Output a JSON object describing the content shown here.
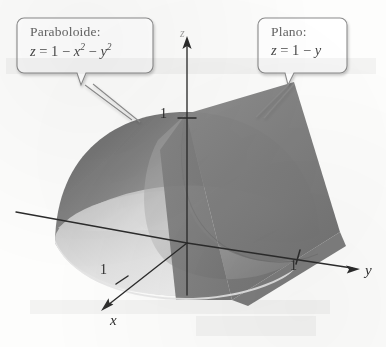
{
  "figure": {
    "kind": "3d-solid-diagram",
    "background_color": "#fdfdfc"
  },
  "callouts": [
    {
      "id": "paraboloid",
      "title": "Paraboloide:",
      "equation_plain": "z = 1 - x2 - y2",
      "lhs": "z",
      "eq": "=",
      "term1": "1",
      "minus1": "−",
      "term2_base": "x",
      "term2_exp": "2",
      "minus2": "−",
      "term3_base": "y",
      "term3_exp": "2"
    },
    {
      "id": "plane",
      "title": "Plano:",
      "equation_plain": "z = 1 - y",
      "lhs": "z",
      "eq": "=",
      "term1": "1",
      "minus1": "−",
      "term2_base": "y"
    }
  ],
  "axes": [
    {
      "id": "x",
      "label": "x",
      "tick_label": "1",
      "direction": "down-left"
    },
    {
      "id": "y",
      "label": "y",
      "tick_label": "1",
      "direction": "right"
    },
    {
      "id": "z",
      "label": "z",
      "tick_label": "1",
      "direction": "up"
    }
  ],
  "colors": {
    "plane_fill": "#7d7d7d",
    "plane_fill_dark": "#6a6a6a",
    "surface_dark": "#6f6f6f",
    "surface_mid": "#9a9a9a",
    "surface_light": "#d7d7d7",
    "surface_highlight": "#efefef",
    "axis_stroke": "#2b2b2b",
    "callout_stroke": "#8c8c8c",
    "text": "#3a3a3a"
  }
}
